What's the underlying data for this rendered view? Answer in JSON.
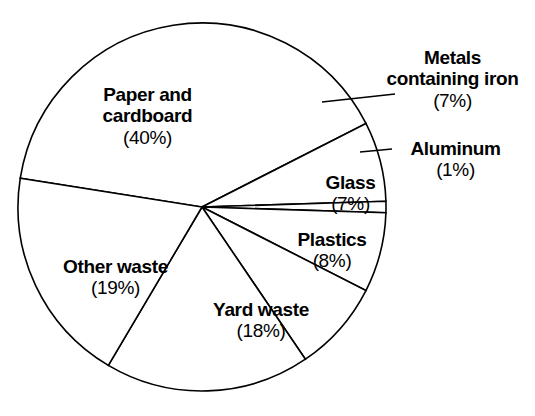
{
  "chart_data": {
    "type": "pie",
    "title": "Composition of Waste by Weight",
    "xlabel": "",
    "ylabel": "",
    "grid": false,
    "legend": "none",
    "units": "percent",
    "total": 100,
    "categories": [
      "Paper and cardboard",
      "Metals containing iron",
      "Aluminum",
      "Glass",
      "Plastics",
      "Yard waste",
      "Other waste"
    ],
    "values": [
      40,
      7,
      1,
      7,
      8,
      18,
      19
    ],
    "slices": [
      {
        "name": "Paper and",
        "name_line2": "cardboard",
        "percent_label": "(40%)",
        "value": 40,
        "color": "#ffffff",
        "has_leader_line": false
      },
      {
        "name": "Metals",
        "name_line2": "containing iron",
        "percent_label": "(7%)",
        "value": 7,
        "color": "#ffffff",
        "has_leader_line": true
      },
      {
        "name": "Aluminum",
        "name_line2": "",
        "percent_label": "(1%)",
        "value": 1,
        "color": "#ffffff",
        "has_leader_line": true
      },
      {
        "name": "Glass",
        "name_line2": "",
        "percent_label": "(7%)",
        "value": 7,
        "color": "#ffffff",
        "has_leader_line": false
      },
      {
        "name": "Plastics",
        "name_line2": "",
        "percent_label": "(8%)",
        "value": 8,
        "color": "#ffffff",
        "has_leader_line": false
      },
      {
        "name": "Yard waste",
        "name_line2": "",
        "percent_label": "(18%)",
        "value": 18,
        "color": "#ffffff",
        "has_leader_line": false
      },
      {
        "name": "Other waste",
        "name_line2": "",
        "percent_label": "(19%)",
        "value": 19,
        "color": "#ffffff",
        "has_leader_line": false
      }
    ],
    "stroke_color": "#000000",
    "background_color": "#ffffff"
  }
}
